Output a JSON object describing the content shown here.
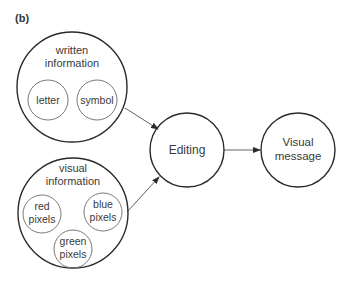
{
  "panel_label": "(b)",
  "nodes": {
    "written": {
      "label_line1": "written",
      "label_line2": "information",
      "children": {
        "letter": "letter",
        "symbol": "symbol"
      }
    },
    "visual": {
      "label_line1": "visual",
      "label_line2": "information",
      "children": {
        "red": {
          "line1": "red",
          "line2": "pixels"
        },
        "blue": {
          "line1": "blue",
          "line2": "pixels"
        },
        "green": {
          "line1": "green",
          "line2": "pixels"
        }
      }
    },
    "editing": {
      "label": "Editing"
    },
    "visual_message": {
      "label_line1": "Visual",
      "label_line2": "message"
    }
  },
  "edges": [
    {
      "from": "written information",
      "to": "Editing"
    },
    {
      "from": "visual information",
      "to": "Editing"
    },
    {
      "from": "Editing",
      "to": "Visual message"
    }
  ],
  "colors": {
    "outer_stroke": "#2b2b2b",
    "inner_stroke": "#6a6a6a",
    "text": "#3a3a3a"
  }
}
